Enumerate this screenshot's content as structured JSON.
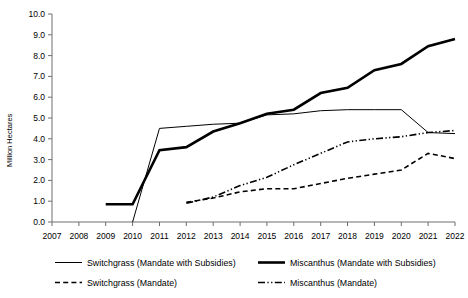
{
  "chart_data": {
    "type": "line",
    "title": "",
    "xlabel": "",
    "ylabel": "Million Hectares",
    "ylim": [
      0.0,
      10.0
    ],
    "yticks": [
      "0.0",
      "1.0",
      "2.0",
      "3.0",
      "4.0",
      "5.0",
      "6.0",
      "7.0",
      "8.0",
      "9.0",
      "10.0"
    ],
    "grid": false,
    "legend_position": "bottom",
    "x": [
      2007,
      2008,
      2009,
      2010,
      2011,
      2012,
      2013,
      2014,
      2015,
      2016,
      2017,
      2018,
      2019,
      2020,
      2021,
      2022
    ],
    "categories": [
      "2007",
      "2008",
      "2009",
      "2010",
      "2011",
      "2012",
      "2013",
      "2014",
      "2015",
      "2016",
      "2017",
      "2018",
      "2019",
      "2020",
      "2021",
      "2022"
    ],
    "series": [
      {
        "name": "Switchgrass (Mandate with Subsidies)",
        "style": "solid-thin",
        "values": [
          null,
          null,
          null,
          0.0,
          4.5,
          4.6,
          4.7,
          4.75,
          5.15,
          5.2,
          5.35,
          5.4,
          5.4,
          5.4,
          4.3,
          4.25
        ]
      },
      {
        "name": "Switchgrass (Mandate)",
        "style": "dashed",
        "values": [
          null,
          null,
          null,
          null,
          null,
          0.95,
          1.15,
          1.45,
          1.6,
          1.6,
          1.85,
          2.1,
          2.3,
          2.5,
          3.3,
          3.05
        ]
      },
      {
        "name": "Miscanthus (Mandate with Subsidies)",
        "style": "solid-thick",
        "values": [
          null,
          null,
          0.85,
          0.85,
          3.45,
          3.6,
          4.35,
          4.75,
          5.2,
          5.4,
          6.2,
          6.45,
          7.3,
          7.6,
          8.45,
          8.8
        ]
      },
      {
        "name": "Miscanthus (Mandate)",
        "style": "dash-dot-dot",
        "values": [
          null,
          null,
          null,
          null,
          null,
          0.9,
          1.2,
          1.75,
          2.15,
          2.75,
          3.3,
          3.85,
          4.0,
          4.1,
          4.3,
          4.4
        ]
      }
    ],
    "legend": [
      {
        "label": "Switchgrass (Mandate with Subsidies)",
        "style": "solid-thin"
      },
      {
        "label": "Switchgrass (Mandate)",
        "style": "dashed"
      },
      {
        "label": "Miscanthus (Mandate with Subsidies)",
        "style": "solid-thick"
      },
      {
        "label": "Miscanthus (Mandate)",
        "style": "dash-dot-dot"
      }
    ],
    "colors": {
      "line": "#000000",
      "axis": "#6e6e6e",
      "background": "#ffffff"
    }
  }
}
